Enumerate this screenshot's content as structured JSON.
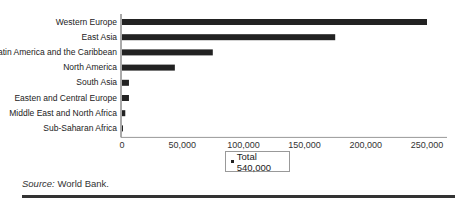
{
  "chart_data": {
    "type": "bar",
    "orientation": "horizontal",
    "title": "",
    "xlabel": "",
    "ylabel": "",
    "categories": [
      "Western Europe",
      "East Asia",
      "Latin America and the Caribbean",
      "North America",
      "South Asia",
      "Easten and Central Europe",
      "Middle East and North Africa",
      "Sub-Saharan Africa"
    ],
    "series": [
      {
        "name": "Total 540,000",
        "values": [
          250000,
          175000,
          75000,
          44000,
          6500,
          6500,
          3500,
          1000
        ]
      }
    ],
    "xlim": [
      0,
      250000
    ],
    "xticks": [
      0,
      50000,
      100000,
      150000,
      200000,
      250000
    ],
    "xtick_labels": [
      "0",
      "50,000",
      "100,000",
      "150,000",
      "200,000",
      "250,000"
    ],
    "grid": false,
    "legend": {
      "position": "bottom-center",
      "entries": [
        "Total 540,000"
      ]
    },
    "bar_color": "#222222"
  },
  "legend_label": "Total 540,000",
  "source": {
    "label": "Source:",
    "text": " World Bank."
  }
}
